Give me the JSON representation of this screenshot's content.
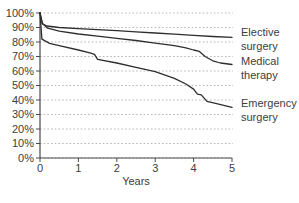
{
  "chart_data": {
    "type": "line",
    "subtype": "survival-step-curves",
    "title": "",
    "xlabel": "Years",
    "ylabel": "",
    "xlim": [
      0,
      5
    ],
    "ylim": [
      0,
      100
    ],
    "grid": "horizontal dotted lines every 10%",
    "legend_position": "right-of-plot, text labels beside curve ends",
    "x_ticks": [
      "0",
      "1",
      "2",
      "3",
      "4",
      "5"
    ],
    "y_ticks": [
      "100%",
      "90%",
      "80%",
      "70%",
      "60%",
      "50%",
      "40%",
      "30%",
      "20%",
      "10%",
      "0%"
    ],
    "y_tick_values": [
      100,
      90,
      80,
      70,
      60,
      50,
      40,
      30,
      20,
      10,
      0
    ],
    "series": [
      {
        "name": "Elective surgery",
        "label_lines": [
          "Elective",
          "surgery"
        ],
        "x": [
          0,
          0.06,
          0.18,
          0.5,
          1,
          1.5,
          2,
          2.5,
          3,
          3.5,
          4,
          4.5,
          5
        ],
        "y": [
          100,
          92.5,
          91,
          90,
          89.2,
          88.5,
          87.8,
          87,
          86.2,
          85.4,
          84.6,
          83.8,
          83.2
        ]
      },
      {
        "name": "Medical therapy",
        "label_lines": [
          "Medical",
          "therapy"
        ],
        "x": [
          0,
          0.06,
          0.2,
          0.5,
          1,
          1.5,
          2,
          2.5,
          2.9,
          3.2,
          3.5,
          3.8,
          4.0,
          4.15,
          4.3,
          4.5,
          4.7,
          5
        ],
        "y": [
          100,
          93,
          89.5,
          87.5,
          85.5,
          84,
          82.5,
          81,
          79.5,
          78.5,
          77.5,
          76,
          74.5,
          73.5,
          70,
          67,
          65.5,
          64.5
        ]
      },
      {
        "name": "Emergency surgery",
        "label_lines": [
          "Emergency",
          "surgery"
        ],
        "x": [
          0,
          0.05,
          0.25,
          0.5,
          1,
          1.3,
          1.42,
          1.5,
          2,
          2.5,
          3,
          3.5,
          3.8,
          4.0,
          4.1,
          4.2,
          4.35,
          4.6,
          5
        ],
        "y": [
          100,
          82,
          79,
          77.5,
          74.5,
          72.5,
          71.5,
          68,
          65.5,
          62.5,
          59.5,
          55,
          51,
          47.5,
          44,
          43.5,
          39,
          37.5,
          35
        ]
      }
    ]
  },
  "colors": {
    "background": "#ffffff",
    "curve": "#2e2e2e",
    "grid": "#b3b3b3",
    "axis": "#4a4a4a",
    "text": "#3d3d3d"
  },
  "layout_values": {
    "plot_left_px": 40,
    "plot_right_px": 232,
    "plot_top_px": 13,
    "plot_bottom_px": 158,
    "grid_right_px": 233
  }
}
